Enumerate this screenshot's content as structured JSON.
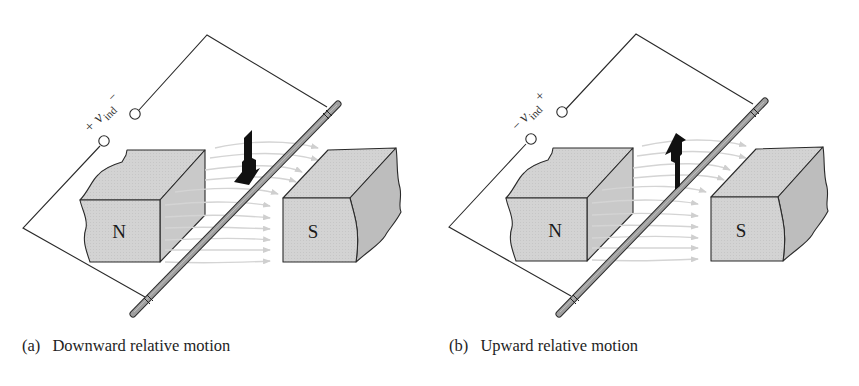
{
  "figure": {
    "panels": [
      {
        "id": "a",
        "caption_tag": "(a)",
        "caption_text": "Downward relative motion",
        "voltage_label": {
          "left_sign": "+",
          "symbol": "v",
          "subscript": "ind",
          "right_sign": "−"
        },
        "north_pole_label": "N",
        "south_pole_label": "S",
        "motion_direction": "down"
      },
      {
        "id": "b",
        "caption_tag": "(b)",
        "caption_text": "Upward relative motion",
        "voltage_label": {
          "left_sign": "−",
          "symbol": "v",
          "subscript": "ind",
          "right_sign": "+"
        },
        "north_pole_label": "N",
        "south_pole_label": "S",
        "motion_direction": "up"
      }
    ],
    "colors": {
      "magnet_face": "#d2d2d2",
      "magnet_side": "#c4c4c4",
      "magnet_broken": "#b8b8b8",
      "outline": "#2a2a2a",
      "flux_lines": "#d6d6d6",
      "rod": "#8a8a8a",
      "arrow": "#111111"
    }
  }
}
